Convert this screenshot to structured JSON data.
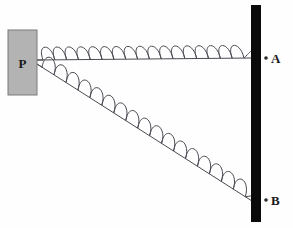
{
  "figure": {
    "type": "physics-diagram",
    "background_color": "#fefefe",
    "width": 293,
    "height": 228
  },
  "block": {
    "label": "P",
    "fill_color": "#b3b3b3",
    "border_color": "#7a7a7a",
    "x": 8,
    "y": 30,
    "width": 29,
    "height": 65
  },
  "wall": {
    "name": "vertical-wall",
    "color": "#0a0a0a",
    "x": 251,
    "y": 5,
    "width": 10,
    "height": 217
  },
  "anchors": [
    {
      "label": "A",
      "name": "anchor-a",
      "x": 266,
      "y": 58,
      "dot_color": "#2a2a2a"
    },
    {
      "label": "B",
      "name": "anchor-b",
      "x": 266,
      "y": 200,
      "dot_color": "#2a2a2a"
    }
  ],
  "springs": [
    {
      "name": "horizontal-spring",
      "from": "P",
      "to": "A",
      "start_x": 37,
      "start_y": 60,
      "end_x": 252,
      "end_y": 58,
      "coils": 17,
      "amplitude": 11,
      "stroke_color": "#4a4a52",
      "stroke_width": 1.0
    },
    {
      "name": "diagonal-spring",
      "from": "P",
      "to": "B",
      "start_x": 37,
      "start_y": 64,
      "end_x": 252,
      "end_y": 201,
      "coils": 17,
      "amplitude": 11,
      "stroke_color": "#4a4a52",
      "stroke_width": 1.0
    }
  ],
  "labels": {
    "block_label": "P",
    "anchor_a_label": "A",
    "anchor_b_label": "B"
  }
}
